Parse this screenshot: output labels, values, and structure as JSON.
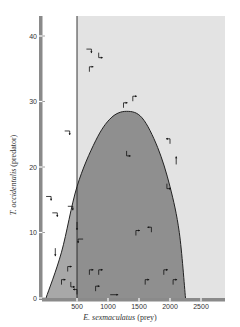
{
  "chart_data": {
    "type": "scatter",
    "title": "",
    "xlabel": "E. sexmaculatus (prey)",
    "xlabel_italic": "E. sexmaculatus",
    "xlabel_rest": " (prey)",
    "ylabel": "T. occidentalis (predator)",
    "ylabel_italic": "T. occidentalis",
    "ylabel_rest": " (predator)",
    "xlim": [
      0,
      2900
    ],
    "ylim": [
      0,
      43
    ],
    "x_ticks": [
      500,
      1000,
      1500,
      2000,
      2500
    ],
    "x_tick_labels": [
      "500",
      "1000",
      "1500",
      "2000",
      "2500"
    ],
    "y_ticks": [
      0,
      10,
      20,
      30,
      40
    ],
    "y_tick_labels": [
      "0",
      "10",
      "20",
      "30",
      "40"
    ],
    "grid": false,
    "legend": null,
    "regions": [
      {
        "name": "light-shaded-zone",
        "color": "#e3e3e3",
        "description": "Region where prey > ~500 (right of vertical prey isocline)",
        "x_range": [
          500,
          2900
        ],
        "y_range": [
          0,
          43
        ]
      },
      {
        "name": "predator-increase-zone",
        "color": "#a9a9a9",
        "description": "Region under parabolic predator isocline (from origin, peak ~1300 prey / ~28 predators, ends ~2250 prey)"
      },
      {
        "name": "overlap-zone",
        "color": "#8e8e8e",
        "description": "Intersection of prey>500 and under-curve region"
      }
    ],
    "isoclines": [
      {
        "name": "prey-isocline",
        "type": "vertical-line",
        "x": 500
      },
      {
        "name": "predator-isocline",
        "type": "curve",
        "points": [
          [
            0,
            0
          ],
          [
            250,
            7
          ],
          [
            500,
            17
          ],
          [
            800,
            24
          ],
          [
            1050,
            27.5
          ],
          [
            1300,
            28.5
          ],
          [
            1550,
            27.5
          ],
          [
            1800,
            23
          ],
          [
            2000,
            17
          ],
          [
            2150,
            10
          ],
          [
            2250,
            0
          ]
        ]
      }
    ],
    "trend_arrows": [
      {
        "prey": 700,
        "predator": 38,
        "dir": "right-down"
      },
      {
        "prey": 850,
        "predator": 37,
        "dir": "down-right"
      },
      {
        "prey": 700,
        "predator": 35,
        "dir": "up-right"
      },
      {
        "prey": 350,
        "predator": 25.5,
        "dir": "right-down"
      },
      {
        "prey": 1250,
        "predator": 29.5,
        "dir": "up-right"
      },
      {
        "prey": 1400,
        "predator": 30.5,
        "dir": "up-right"
      },
      {
        "prey": 1300,
        "predator": 22,
        "dir": "down-right"
      },
      {
        "prey": 2000,
        "predator": 24,
        "dir": "up-left"
      },
      {
        "prey": 2100,
        "predator": 21,
        "dir": "up"
      },
      {
        "prey": 1950,
        "predator": 17,
        "dir": "down-right"
      },
      {
        "prey": 50,
        "predator": 15.5,
        "dir": "right-down"
      },
      {
        "prey": 150,
        "predator": 13,
        "dir": "right-down"
      },
      {
        "prey": 400,
        "predator": 14,
        "dir": "right-down"
      },
      {
        "prey": 500,
        "predator": 11,
        "dir": "down"
      },
      {
        "prey": 550,
        "predator": 9,
        "dir": "left-down"
      },
      {
        "prey": 150,
        "predator": 7,
        "dir": "down"
      },
      {
        "prey": 350,
        "predator": 4.5,
        "dir": "up-right"
      },
      {
        "prey": 250,
        "predator": 2.5,
        "dir": "up-right"
      },
      {
        "prey": 400,
        "predator": 2,
        "dir": "down-right"
      },
      {
        "prey": 500,
        "predator": 1,
        "dir": "up-left"
      },
      {
        "prey": 700,
        "predator": 4,
        "dir": "up-right"
      },
      {
        "prey": 850,
        "predator": 4,
        "dir": "up-right"
      },
      {
        "prey": 800,
        "predator": 1.5,
        "dir": "up-right"
      },
      {
        "prey": 1100,
        "predator": 0.5,
        "dir": "right"
      },
      {
        "prey": 1450,
        "predator": 10,
        "dir": "up-right"
      },
      {
        "prey": 1700,
        "predator": 10.5,
        "dir": "up-left"
      },
      {
        "prey": 1900,
        "predator": 4,
        "dir": "up-right"
      },
      {
        "prey": 1600,
        "predator": 2.5,
        "dir": "up-right"
      },
      {
        "prey": 2050,
        "predator": 2.5,
        "dir": "up-right"
      }
    ],
    "colors": {
      "light_region": "#e3e3e3",
      "dark_region": "#8f8f8f",
      "left_under_curve": "#a8a8a8",
      "axis_bar": "#8a8a8a",
      "line": "#222222",
      "arrow": "#111111"
    }
  }
}
